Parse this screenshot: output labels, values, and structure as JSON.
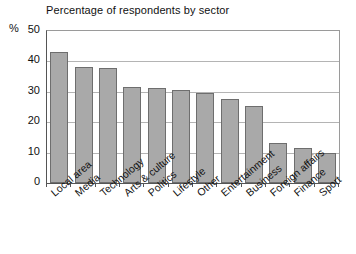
{
  "chart_data": {
    "type": "bar",
    "title": "Percentage of respondents by sector",
    "xlabel": "",
    "ylabel": "%",
    "ylim": [
      0,
      50
    ],
    "yticks": [
      0,
      10,
      20,
      30,
      40,
      50
    ],
    "grid": true,
    "legend": "none",
    "orientation": "vertical",
    "bar_color": "#a9a9a9",
    "bar_edge_color": "#6e6e6e",
    "categories": [
      "Local area",
      "Media",
      "Technology",
      "Arts & culture",
      "Politics",
      "Lifestyle",
      "Other",
      "Entertainment",
      "Business",
      "Foreign affairs",
      "Finance",
      "Sport"
    ],
    "values": [
      43,
      38.2,
      37.9,
      31.5,
      31.2,
      30.6,
      29.6,
      27.5,
      25.3,
      13,
      11.4,
      9.8
    ]
  },
  "axis": {
    "y_unit_label": "%",
    "y_tick_labels": [
      "50",
      "40",
      "30",
      "20",
      "10",
      "0"
    ]
  }
}
